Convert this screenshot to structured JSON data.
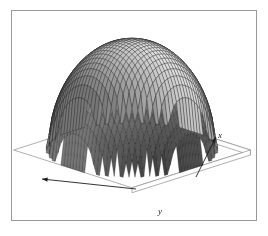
{
  "figure": {
    "background_color": "#ffffff",
    "frame": {
      "border_color": "#9a9a9a",
      "x": 11,
      "y": 10,
      "width": 246,
      "height": 211
    }
  },
  "axes": {
    "x_label": "x",
    "y_label": "y",
    "x_axis_arrow": "arrow-up-right",
    "y_axis_arrow": "arrow-left",
    "label_style": "italic-serif"
  },
  "chart_data": {
    "type": "surface",
    "title": "",
    "subtitle": "",
    "xlabel": "x",
    "ylabel": "y",
    "zlabel": "",
    "render_style": "wireframe-mesh-shaded",
    "mesh_color": "#1c1c1c",
    "face_color": "#c8c8c8",
    "shadow_color": "#2a2a2a",
    "base_color": "#ffffff",
    "grid": false,
    "legend": false,
    "legend_position": "none",
    "nx": 40,
    "ny": 40,
    "xlim": [
      -1,
      1
    ],
    "ylim": [
      -1,
      1
    ],
    "zlim": [
      0,
      1
    ],
    "surface_function": "z = sqrt(max(0, 1 - x^2 - y^2))",
    "view": {
      "azimuth_deg": -45,
      "elevation_deg": 28
    },
    "x": [
      -1.0,
      -0.95,
      -0.9,
      -0.85,
      -0.8,
      -0.75,
      -0.7,
      -0.65,
      -0.6,
      -0.55,
      -0.5,
      -0.45,
      -0.4,
      -0.35,
      -0.3,
      -0.25,
      -0.2,
      -0.15,
      -0.1,
      -0.05,
      0.0,
      0.05,
      0.1,
      0.15,
      0.2,
      0.25,
      0.3,
      0.35,
      0.4,
      0.45,
      0.5,
      0.55,
      0.6,
      0.65,
      0.7,
      0.75,
      0.8,
      0.85,
      0.9,
      0.95,
      1.0
    ],
    "y": [
      -1.0,
      -0.95,
      -0.9,
      -0.85,
      -0.8,
      -0.75,
      -0.7,
      -0.65,
      -0.6,
      -0.55,
      -0.5,
      -0.45,
      -0.4,
      -0.35,
      -0.3,
      -0.25,
      -0.2,
      -0.15,
      -0.1,
      -0.05,
      0.0,
      0.05,
      0.1,
      0.15,
      0.2,
      0.25,
      0.3,
      0.35,
      0.4,
      0.45,
      0.5,
      0.55,
      0.6,
      0.65,
      0.7,
      0.75,
      0.8,
      0.85,
      0.9,
      0.95,
      1.0
    ],
    "z_profile_along_y0": [
      0.0,
      0.31,
      0.44,
      0.53,
      0.6,
      0.66,
      0.71,
      0.76,
      0.8,
      0.84,
      0.87,
      0.89,
      0.92,
      0.94,
      0.95,
      0.97,
      0.98,
      0.99,
      0.99,
      1.0,
      1.0,
      1.0,
      0.99,
      0.99,
      0.98,
      0.97,
      0.95,
      0.94,
      0.92,
      0.89,
      0.87,
      0.84,
      0.8,
      0.76,
      0.71,
      0.66,
      0.6,
      0.53,
      0.44,
      0.31,
      0.0
    ]
  }
}
